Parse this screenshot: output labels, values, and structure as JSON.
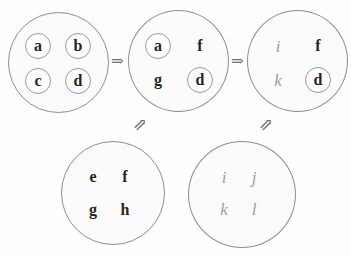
{
  "figure": {
    "type": "set-transition-diagram",
    "background_color": "#fefefe",
    "circle_stroke_color": "#8e8e8e",
    "dark_glyph_color": "#252525",
    "gray_glyph_color": "#9d9d9d"
  },
  "top_row": {
    "circles": [
      {
        "id": "state-1",
        "items": [
          {
            "label": "a",
            "ringed": true,
            "style": "dark"
          },
          {
            "label": "b",
            "ringed": true,
            "style": "dark"
          },
          {
            "label": "c",
            "ringed": true,
            "style": "dark"
          },
          {
            "label": "d",
            "ringed": true,
            "style": "dark"
          }
        ]
      },
      {
        "id": "state-2",
        "items": [
          {
            "label": "a",
            "ringed": true,
            "style": "dark"
          },
          {
            "label": "f",
            "ringed": false,
            "style": "dark"
          },
          {
            "label": "g",
            "ringed": false,
            "style": "dark"
          },
          {
            "label": "d",
            "ringed": true,
            "style": "dark"
          }
        ]
      },
      {
        "id": "state-3",
        "items": [
          {
            "label": "i",
            "ringed": false,
            "style": "gray"
          },
          {
            "label": "f",
            "ringed": false,
            "style": "dark"
          },
          {
            "label": "k",
            "ringed": false,
            "style": "gray"
          },
          {
            "label": "d",
            "ringed": true,
            "style": "dark"
          }
        ]
      }
    ]
  },
  "bottom_row": {
    "circles": [
      {
        "id": "source-1",
        "items": [
          {
            "label": "e",
            "ringed": false,
            "style": "dark"
          },
          {
            "label": "f",
            "ringed": false,
            "style": "dark"
          },
          {
            "label": "g",
            "ringed": false,
            "style": "dark"
          },
          {
            "label": "h",
            "ringed": false,
            "style": "dark"
          }
        ]
      },
      {
        "id": "source-2",
        "items": [
          {
            "label": "i",
            "ringed": false,
            "style": "gray"
          },
          {
            "label": "j",
            "ringed": false,
            "style": "gray"
          },
          {
            "label": "k",
            "ringed": false,
            "style": "gray"
          },
          {
            "label": "l",
            "ringed": false,
            "style": "gray"
          }
        ]
      }
    ]
  },
  "arrows": {
    "horizontal": [
      {
        "id": "arrow-1-to-2",
        "glyph": "⇒"
      },
      {
        "id": "arrow-2-to-3",
        "glyph": "⇒"
      }
    ],
    "diagonal": [
      {
        "id": "arrow-source1-up",
        "glyph": "⇗"
      },
      {
        "id": "arrow-source2-up",
        "glyph": "⇗"
      }
    ]
  }
}
